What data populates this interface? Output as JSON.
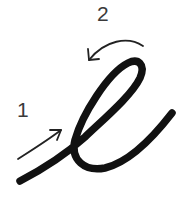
{
  "diagram": {
    "type": "stroke-order",
    "letter": "cursive e",
    "steps": [
      {
        "number": "1",
        "description": "upward entry stroke"
      },
      {
        "number": "2",
        "description": "loop stroke counter-clockwise"
      }
    ],
    "colors": {
      "stroke": "#111111",
      "arrow": "#222222",
      "label": "#3a3a3a",
      "background": "#ffffff"
    }
  }
}
